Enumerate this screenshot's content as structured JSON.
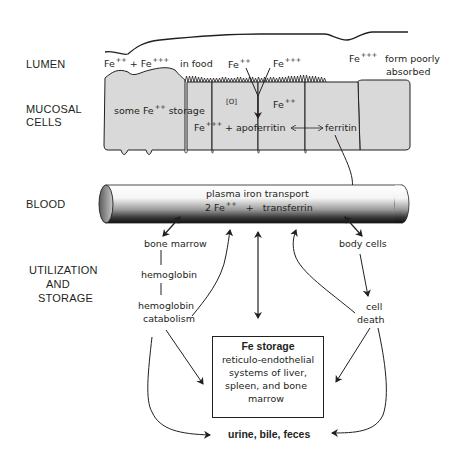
{
  "regions": {
    "lumen": "LUMEN",
    "mucosal_line1": "MUCOSAL",
    "mucosal_line2": "CELLS",
    "blood": "BLOOD",
    "util_line1": "UTILIZATION",
    "util_line2": "AND",
    "util_line3": "STORAGE"
  },
  "lumen": {
    "fe2": "Fe",
    "fe2_charge": "++",
    "plus": "+",
    "fe3": "Fe",
    "fe3_charge": "+++",
    "in_food": "in food",
    "fe2_entry": "Fe",
    "fe2_entry_charge": "++",
    "fe3_entry": "Fe",
    "fe3_entry_charge": "+++",
    "fe3_poor": "Fe",
    "fe3_poor_charge": "+++",
    "poor_line1": "form poorly",
    "poor_line2": "absorbed"
  },
  "mucosa": {
    "storage_some": "some",
    "storage_fe": "Fe",
    "storage_charge": "++",
    "storage_word": "storage",
    "oxidation": "[O]",
    "fe2": "Fe",
    "fe2_charge": "++",
    "fe3": "Fe",
    "fe3_charge": "+++",
    "apoferritin": "+ apoferritin",
    "ferritin": "ferritin"
  },
  "blood": {
    "line1": "plasma iron transport",
    "fe_coef": "2 Fe",
    "fe_charge": "++",
    "plus": "+",
    "transferrin": "transferrin"
  },
  "utilization": {
    "bone_marrow": "bone marrow",
    "hemoglobin": "hemoglobin",
    "hb_cat_line1": "hemoglobin",
    "hb_cat_line2": "catabolism",
    "body_cells": "body cells",
    "cell_death_line1": "cell",
    "cell_death_line2": "death"
  },
  "storage_box": {
    "title": "Fe storage",
    "line1": "reticulo-endothelial",
    "line2": "systems of liver,",
    "line3": "spleen, and bone",
    "line4": "marrow"
  },
  "excretion": "urine, bile, feces",
  "colors": {
    "cell_fill": "#d9d9d9",
    "ink": "#231f20",
    "tube_dark": "#1a1a1a",
    "tube_light": "#ffffff"
  }
}
